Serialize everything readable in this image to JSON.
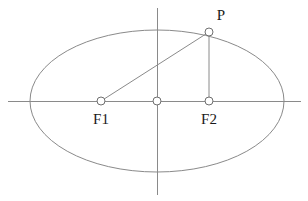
{
  "figure": {
    "canvas": {
      "width": 308,
      "height": 201,
      "background": "#ffffff"
    },
    "colors": {
      "stroke": "#8a8a8a",
      "marker_stroke": "#6f6f6f",
      "marker_fill": "#ffffff",
      "text": "#1a1a1a"
    }
  },
  "geometry": {
    "ellipse": {
      "cx": 157,
      "cy": 101,
      "rx": 127,
      "ry": 71
    },
    "x_axis": {
      "x1": 8,
      "y1": 101,
      "x2": 301,
      "y2": 101
    },
    "y_axis": {
      "x1": 157,
      "y1": 8,
      "x2": 157,
      "y2": 195
    }
  },
  "points": [
    {
      "id": "focus-1",
      "label": "F1",
      "cx": 101,
      "cy": 101,
      "r": 4,
      "label_x": 101,
      "label_y": 124,
      "label_anchor": "middle"
    },
    {
      "id": "center",
      "label": "",
      "cx": 157,
      "cy": 101,
      "r": 4,
      "label_x": 157,
      "label_y": 124,
      "label_anchor": "middle"
    },
    {
      "id": "focus-2",
      "label": "F2",
      "cx": 209,
      "cy": 101,
      "r": 4,
      "label_x": 209,
      "label_y": 124,
      "label_anchor": "middle"
    },
    {
      "id": "point-p",
      "label": "P",
      "cx": 209,
      "cy": 32,
      "r": 4,
      "label_x": 221,
      "label_y": 20,
      "label_anchor": "middle"
    }
  ],
  "segments": [
    {
      "id": "focus1-to-p",
      "x1": 101,
      "y1": 101,
      "x2": 209,
      "y2": 32
    },
    {
      "id": "p-to-focus2",
      "x1": 209,
      "y1": 32,
      "x2": 209,
      "y2": 101
    }
  ],
  "labels": {
    "focus_1": "F1",
    "focus_2": "F2",
    "point_p": "P"
  }
}
